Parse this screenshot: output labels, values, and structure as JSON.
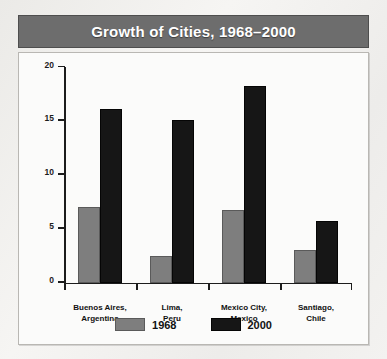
{
  "chart_data": {
    "type": "bar",
    "title": "Growth of Cities, 1968–2000",
    "xlabel": "",
    "ylabel": "Population in Millions",
    "ylim": [
      0,
      20
    ],
    "yticks": [
      0,
      5,
      10,
      15,
      20
    ],
    "ytick_labels": [
      "0",
      "5",
      "10",
      "15",
      "20"
    ],
    "grid": false,
    "legend_position": "bottom",
    "categories": [
      "Buenos Aires,\nArgentina",
      "Lima,\nPeru",
      "Mexico City,\nMexico",
      "Santiago,\nChile"
    ],
    "category_lines": [
      [
        "Buenos Aires,",
        "Argentina"
      ],
      [
        "Lima,",
        "Peru"
      ],
      [
        "Mexico City,",
        "Mexico"
      ],
      [
        "Santiago,",
        "Chile"
      ]
    ],
    "series": [
      {
        "name": "1968",
        "color": "#7e7e7e",
        "values": [
          7.0,
          2.5,
          6.7,
          3.0
        ]
      },
      {
        "name": "2000",
        "color": "#161616",
        "values": [
          16.1,
          15.1,
          18.2,
          5.7
        ]
      }
    ]
  },
  "legend": {
    "items": [
      {
        "label": "1968",
        "series": "1968"
      },
      {
        "label": "2000",
        "series": "2000"
      }
    ]
  },
  "colors": {
    "title_bar": "#6d6d6d",
    "title_text": "#ffffff",
    "panel_background": "#fbfbfa",
    "axis": "#1c1c1c",
    "bar_1968": "#7e7e7e",
    "bar_2000": "#161616"
  }
}
